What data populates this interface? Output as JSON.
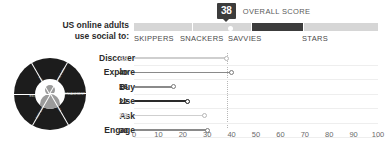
{
  "score": {
    "value": "38",
    "caption": "OVERALL SCORE"
  },
  "heading": {
    "line1": "US online adults",
    "line2": "use social to:"
  },
  "segments": [
    {
      "label": "SKIPPERS",
      "active": false
    },
    {
      "label": "SNACKERS",
      "active": false
    },
    {
      "label": "SAVVIES",
      "active": true
    },
    {
      "label": "STARS",
      "active": false
    }
  ],
  "donut": {
    "wedges": [
      "DISCOVER",
      "ENGAGEMENT",
      "ASK",
      "EXPLORE",
      "USE",
      "BUY"
    ]
  },
  "chart_data": {
    "type": "bar",
    "title": "US online adults use social to:",
    "xlabel": "",
    "ylabel": "",
    "xlim": [
      0,
      100
    ],
    "xticks": [
      0,
      10,
      20,
      30,
      40,
      50,
      60,
      70,
      80,
      90,
      100
    ],
    "grid": true,
    "legend": "none",
    "reference_line": 38,
    "categories": [
      "Discover",
      "Explore",
      "Buy",
      "Use",
      "Ask",
      "Engage"
    ],
    "values": [
      38,
      40,
      16,
      22,
      29,
      30
    ],
    "value_labels": [
      "38",
      "40",
      "16",
      "22",
      "29",
      "30"
    ],
    "emphasis": [
      "muted",
      "normal",
      "normal",
      "strong",
      "muted",
      "normal"
    ]
  },
  "colors": {
    "dark": "#3c3c3c",
    "light_segment": "#d6d6d6",
    "muted_text": "#c8c8c8",
    "normal_text": "#2b2b2b",
    "grid": "#eeeeee"
  }
}
